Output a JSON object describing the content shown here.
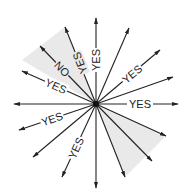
{
  "diagram": {
    "center": [
      96,
      104
    ],
    "colors": {
      "line": "#222222",
      "shade": "#e9e9e9",
      "text": "#222222"
    },
    "labels": {
      "up": "YES",
      "up_left_steep": "YES",
      "up_left": "NO",
      "left_up": "YES",
      "right_up": "YES",
      "right": "YES",
      "left_down": "YES",
      "down_left": "YES"
    }
  }
}
